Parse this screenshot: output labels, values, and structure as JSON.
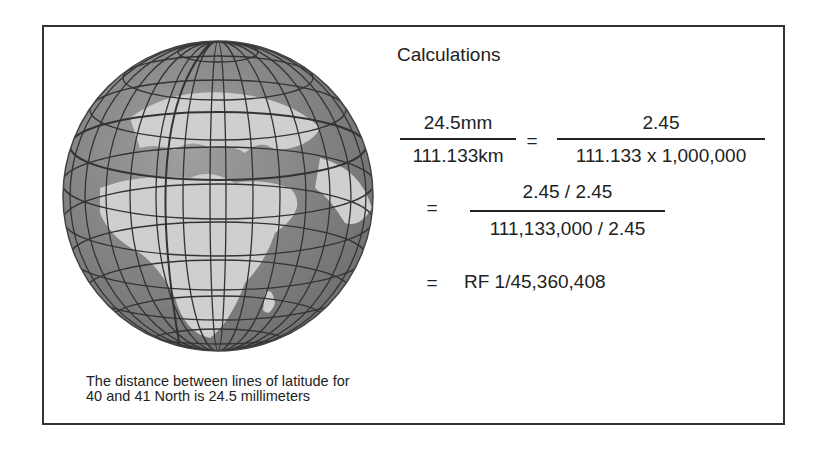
{
  "figure": {
    "title": "Calculations",
    "equations": {
      "step1": {
        "left_numerator": "24.5mm",
        "left_denominator": "111.133km",
        "equals": "=",
        "right_numerator": "2.45",
        "right_denominator": "111.133 x 1,000,000"
      },
      "step2": {
        "equals": "=",
        "numerator": "2.45 / 2.45",
        "denominator": "111,133,000 / 2.45"
      },
      "step3": {
        "equals": "=",
        "result": "RF 1/45,360,408"
      }
    },
    "caption_line1": "The distance between lines of latitude for",
    "caption_line2": "40 and 41 North is 24.5 millimeters",
    "globe": {
      "icon": "globe-graticule-icon",
      "ocean_color": "#8a8a8a",
      "land_color": "#c8c8c8",
      "grid_color": "#333333"
    }
  }
}
